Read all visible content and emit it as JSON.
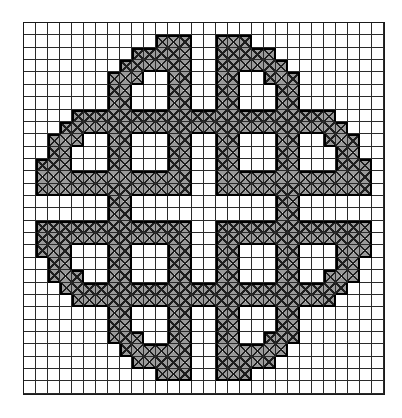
{
  "pattern": {
    "name": "celtic-knot-cross-stitch-chart",
    "grid_cols": 30,
    "grid_rows": 30,
    "symmetry": "four-fold mirror (horizontal and vertical)",
    "colors": {
      "background": "#ffffff",
      "grid_line": "#2a2a2a",
      "stitch_fill": "#9a9a9a",
      "stitch_mark": "#1e1e1e",
      "outline": "#000000"
    },
    "stitch_symbol": "X",
    "top_left_quadrant_filled_cols_by_row": [
      [],
      [
        11,
        12,
        13
      ],
      [
        9,
        10,
        11,
        12,
        13
      ],
      [
        8,
        9,
        10,
        11,
        12,
        13
      ],
      [
        7,
        8,
        9,
        12,
        13
      ],
      [
        7,
        8,
        12,
        13
      ],
      [
        7,
        8,
        12,
        13
      ],
      [
        4,
        5,
        6,
        7,
        8,
        9,
        10,
        11,
        12,
        13,
        14
      ],
      [
        3,
        4,
        5,
        6,
        7,
        8,
        9,
        10,
        11,
        12,
        13,
        14
      ],
      [
        2,
        3,
        4,
        7,
        8,
        12,
        13
      ],
      [
        2,
        3,
        7,
        8,
        12,
        13
      ],
      [
        1,
        2,
        3,
        7,
        8,
        12,
        13
      ],
      [
        1,
        2,
        3,
        4,
        5,
        6,
        7,
        8,
        9,
        10,
        11,
        12,
        13
      ],
      [
        1,
        2,
        3,
        4,
        5,
        6,
        7,
        8,
        9,
        10,
        11,
        12,
        13
      ],
      [
        7,
        8
      ]
    ]
  }
}
